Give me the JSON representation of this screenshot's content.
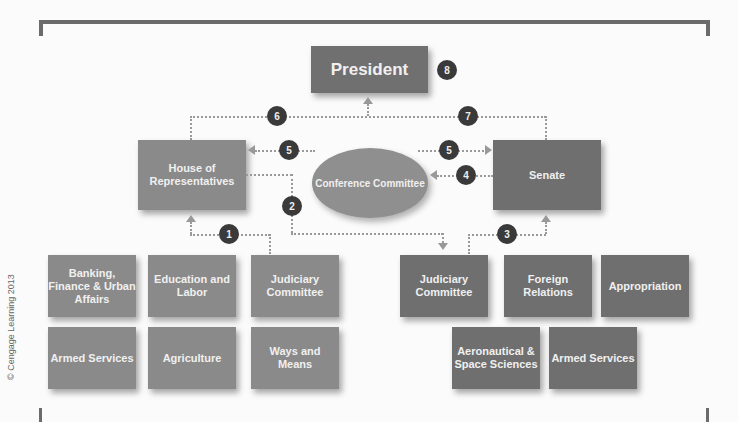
{
  "president": {
    "label": "President",
    "step": "8"
  },
  "house": {
    "label": "House of Representatives"
  },
  "senate": {
    "label": "Senate"
  },
  "conference": {
    "label": "Conference Committee"
  },
  "steps": {
    "s1": "1",
    "s2": "2",
    "s3": "3",
    "s4": "4",
    "s5a": "5",
    "s5b": "5",
    "s6": "6",
    "s7": "7"
  },
  "house_committees": [
    {
      "label": "Banking, Finance & Urban Affairs"
    },
    {
      "label": "Education and Labor"
    },
    {
      "label": "Judiciary Committee"
    },
    {
      "label": "Armed Services"
    },
    {
      "label": "Agriculture"
    },
    {
      "label": "Ways and Means"
    }
  ],
  "senate_committees": [
    {
      "label": "Judiciary Committee"
    },
    {
      "label": "Foreign Relations"
    },
    {
      "label": "Appropriation"
    },
    {
      "label": "Aeronautical & Space Sciences"
    },
    {
      "label": "Armed Services"
    }
  ],
  "credit": "© Cengage Learning 2013"
}
